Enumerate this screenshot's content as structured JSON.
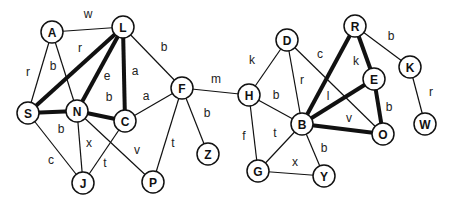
{
  "graph": {
    "node_radius": 11,
    "nodes": [
      {
        "id": "A",
        "x": 52,
        "y": 32
      },
      {
        "id": "L",
        "x": 123,
        "y": 27
      },
      {
        "id": "S",
        "x": 28,
        "y": 113
      },
      {
        "id": "N",
        "x": 77,
        "y": 111
      },
      {
        "id": "C",
        "x": 125,
        "y": 121
      },
      {
        "id": "F",
        "x": 182,
        "y": 88
      },
      {
        "id": "Z",
        "x": 208,
        "y": 154
      },
      {
        "id": "J",
        "x": 83,
        "y": 183
      },
      {
        "id": "P",
        "x": 153,
        "y": 182
      },
      {
        "id": "D",
        "x": 287,
        "y": 40
      },
      {
        "id": "R",
        "x": 355,
        "y": 26
      },
      {
        "id": "K",
        "x": 410,
        "y": 67
      },
      {
        "id": "H",
        "x": 249,
        "y": 95
      },
      {
        "id": "E",
        "x": 374,
        "y": 79
      },
      {
        "id": "B",
        "x": 302,
        "y": 124
      },
      {
        "id": "O",
        "x": 383,
        "y": 134
      },
      {
        "id": "W",
        "x": 425,
        "y": 124
      },
      {
        "id": "G",
        "x": 258,
        "y": 171
      },
      {
        "id": "Y",
        "x": 324,
        "y": 176
      }
    ],
    "edges": [
      {
        "from": "A",
        "to": "L",
        "label": "w",
        "bold": false,
        "lx": 88,
        "ly": 14
      },
      {
        "from": "A",
        "to": "S",
        "label": "r",
        "bold": false,
        "lx": 28,
        "ly": 72
      },
      {
        "from": "A",
        "to": "N",
        "label": "b",
        "bold": false,
        "lx": 53,
        "ly": 66
      },
      {
        "from": "L",
        "to": "S",
        "label": "r",
        "bold": true,
        "lx": 80,
        "ly": 48
      },
      {
        "from": "L",
        "to": "N",
        "label": "e",
        "bold": true,
        "lx": 107,
        "ly": 76
      },
      {
        "from": "L",
        "to": "C",
        "label": "a",
        "bold": true,
        "lx": 135,
        "ly": 71
      },
      {
        "from": "L",
        "to": "F",
        "label": "b",
        "bold": false,
        "lx": 164,
        "ly": 47
      },
      {
        "from": "S",
        "to": "N",
        "label": "",
        "bold": true
      },
      {
        "from": "N",
        "to": "C",
        "label": "b",
        "bold": true,
        "lx": 109,
        "ly": 97
      },
      {
        "from": "S",
        "to": "J",
        "label": "c",
        "bold": false,
        "lx": 51,
        "ly": 160
      },
      {
        "from": "N",
        "to": "J",
        "label": "x",
        "bold": false,
        "lx": 89,
        "ly": 143
      },
      {
        "from": "C",
        "to": "J",
        "label": "t",
        "bold": false,
        "lx": 105,
        "ly": 163
      },
      {
        "from": "N",
        "to": "P",
        "label": "v",
        "bold": false,
        "lx": 137,
        "ly": 150
      },
      {
        "from": "S",
        "to": "N-b",
        "label": "b",
        "bold": false,
        "lx": 61,
        "ly": 129,
        "hidden_line": true
      },
      {
        "from": "C",
        "to": "F",
        "label": "a",
        "bold": false,
        "lx": 146,
        "ly": 96
      },
      {
        "from": "F",
        "to": "P",
        "label": "t",
        "bold": false,
        "lx": 173,
        "ly": 143
      },
      {
        "from": "F",
        "to": "Z",
        "label": "b",
        "bold": false,
        "lx": 207,
        "ly": 113
      },
      {
        "from": "F",
        "to": "H",
        "label": "m",
        "bold": false,
        "lx": 216,
        "ly": 79
      },
      {
        "from": "H",
        "to": "D",
        "label": "k",
        "bold": false,
        "lx": 252,
        "ly": 60
      },
      {
        "from": "H",
        "to": "B",
        "label": "b",
        "bold": false,
        "lx": 276,
        "ly": 95
      },
      {
        "from": "H",
        "to": "G",
        "label": "f",
        "bold": false,
        "lx": 244,
        "ly": 136
      },
      {
        "from": "D",
        "to": "B",
        "label": "r",
        "bold": false,
        "lx": 302,
        "ly": 80
      },
      {
        "from": "D",
        "to": "O",
        "label": "c",
        "bold": false,
        "lx": 320,
        "ly": 54
      },
      {
        "from": "R",
        "to": "B",
        "label": "",
        "bold": true
      },
      {
        "from": "R",
        "to": "E",
        "label": "k",
        "bold": true,
        "lx": 356,
        "ly": 61
      },
      {
        "from": "R",
        "to": "K",
        "label": "b",
        "bold": false,
        "lx": 391,
        "ly": 36
      },
      {
        "from": "B",
        "to": "E",
        "label": "l",
        "bold": true,
        "lx": 328,
        "ly": 96
      },
      {
        "from": "B",
        "to": "O",
        "label": "v",
        "bold": true,
        "lx": 349,
        "ly": 118
      },
      {
        "from": "E",
        "to": "O",
        "label": "b",
        "bold": true,
        "lx": 389,
        "ly": 107
      },
      {
        "from": "K",
        "to": "W",
        "label": "r",
        "bold": false,
        "lx": 431,
        "ly": 92
      },
      {
        "from": "B",
        "to": "G",
        "label": "t",
        "bold": false,
        "lx": 275,
        "ly": 133
      },
      {
        "from": "B",
        "to": "Y",
        "label": "b",
        "bold": false,
        "lx": 324,
        "ly": 148
      },
      {
        "from": "G",
        "to": "Y",
        "label": "x",
        "bold": false,
        "lx": 295,
        "ly": 162
      }
    ]
  }
}
